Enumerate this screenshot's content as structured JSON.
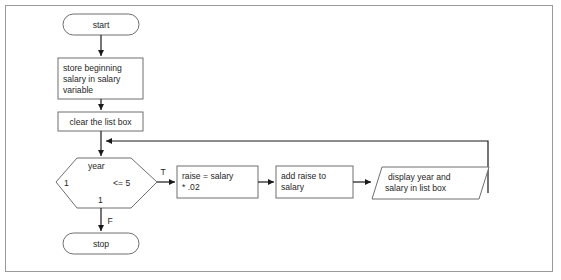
{
  "diagram": {
    "type": "flowchart",
    "background_color": "#ffffff",
    "frame_border_color": "#9a9a9a",
    "shape_stroke_color": "#6f6f6f",
    "connector_color": "#1a1a1a",
    "text_color": "#1f1f1f"
  },
  "nodes": {
    "start": {
      "label": "start",
      "shape": "terminator"
    },
    "store_salary": {
      "label_line1": "store beginning",
      "label_line2": "salary in salary",
      "label_line3": "variable",
      "shape": "process"
    },
    "clear_list": {
      "label": "clear the list box",
      "shape": "process"
    },
    "decision": {
      "top_label": "year",
      "left_label": "1",
      "right_label": "<= 5",
      "bottom_label": "1",
      "shape": "hexagon"
    },
    "raise_calc": {
      "label_line1": "raise = salary",
      "label_line2": "* .02",
      "shape": "process"
    },
    "add_raise": {
      "label_line1": "add raise to",
      "label_line2": "salary",
      "shape": "process"
    },
    "display_output": {
      "label_line1": "display year and",
      "label_line2": "salary in list box",
      "shape": "parallelogram"
    },
    "stop": {
      "label": "stop",
      "shape": "terminator"
    }
  },
  "edge_labels": {
    "true_branch": "T",
    "false_branch": "F"
  }
}
